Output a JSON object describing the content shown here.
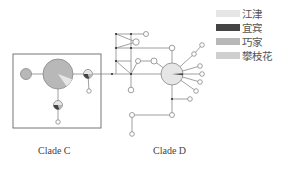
{
  "legend": {
    "items": [
      {
        "label": "江津",
        "color": "#e6e6e6"
      },
      {
        "label": "宜宾",
        "color": "#444444"
      },
      {
        "label": "巧家",
        "color": "#b8b8b8"
      },
      {
        "label": "攀枝花",
        "color": "#cfcfcf"
      }
    ]
  },
  "clades": [
    {
      "label": "Clade C",
      "x": 38,
      "y": 145
    },
    {
      "label": "Clade D",
      "x": 153,
      "y": 145
    }
  ],
  "box": {
    "x": 13,
    "y": 54,
    "w": 88,
    "h": 74
  },
  "edges": [
    [
      29,
      74,
      58,
      74
    ],
    [
      58,
      74,
      88,
      74
    ],
    [
      88,
      74,
      112,
      74
    ],
    [
      112,
      74,
      131,
      74
    ],
    [
      131,
      74,
      172,
      74
    ],
    [
      88,
      74,
      89,
      91
    ],
    [
      58,
      74,
      58,
      105
    ],
    [
      58,
      105,
      58,
      122
    ],
    [
      116,
      34,
      131,
      34
    ],
    [
      131,
      34,
      146,
      34
    ],
    [
      116,
      34,
      136,
      42
    ],
    [
      116,
      48,
      136,
      42
    ],
    [
      116,
      34,
      116,
      48
    ],
    [
      116,
      48,
      116,
      61
    ],
    [
      116,
      61,
      116,
      74
    ],
    [
      116,
      48,
      131,
      48
    ],
    [
      131,
      48,
      172,
      48
    ],
    [
      172,
      48,
      172,
      74
    ],
    [
      131,
      34,
      131,
      48
    ],
    [
      131,
      48,
      131,
      74
    ],
    [
      116,
      61,
      131,
      74
    ],
    [
      131,
      74,
      138,
      61
    ],
    [
      138,
      61,
      154,
      61
    ],
    [
      154,
      61,
      172,
      74
    ],
    [
      116,
      61,
      131,
      61
    ],
    [
      131,
      74,
      131,
      90
    ],
    [
      172,
      74,
      194,
      54
    ],
    [
      194,
      54,
      202,
      45
    ],
    [
      172,
      74,
      200,
      66
    ],
    [
      172,
      74,
      202,
      74
    ],
    [
      172,
      74,
      200,
      82
    ],
    [
      172,
      74,
      196,
      91
    ],
    [
      172,
      74,
      172,
      99
    ],
    [
      172,
      99,
      190,
      99
    ],
    [
      172,
      99,
      172,
      115
    ],
    [
      172,
      115,
      132,
      115
    ],
    [
      132,
      115,
      132,
      134
    ]
  ],
  "small_nodes": [
    [
      146,
      34
    ],
    [
      136,
      42
    ],
    [
      138,
      61
    ],
    [
      154,
      61
    ],
    [
      172,
      48
    ],
    [
      131,
      90
    ],
    [
      202,
      45
    ],
    [
      194,
      54
    ],
    [
      200,
      66
    ],
    [
      202,
      74
    ],
    [
      200,
      82
    ],
    [
      196,
      91
    ],
    [
      190,
      99
    ],
    [
      172,
      115
    ],
    [
      132,
      115
    ],
    [
      132,
      134
    ],
    [
      89,
      91
    ],
    [
      58,
      122
    ]
  ],
  "small_sizes": [
    2.5,
    3.2,
    2.5,
    3,
    2.8,
    2.8,
    2.3,
    2.3,
    2.3,
    2.3,
    2.3,
    2.3,
    2.3,
    2.5,
    2.5,
    2.3,
    2.2,
    2.2
  ],
  "dots": [
    [
      116,
      34
    ],
    [
      131,
      34
    ],
    [
      116,
      48
    ],
    [
      116,
      61
    ],
    [
      131,
      48
    ],
    [
      131,
      74
    ],
    [
      112,
      74
    ],
    [
      172,
      99
    ]
  ],
  "big_nodes": [
    {
      "name": "clade-c-main-haplotype",
      "x": 58,
      "y": 74,
      "r": 15,
      "color": "#b8b8b8",
      "slice": "#e6e6e6"
    },
    {
      "name": "clade-c-left-haplotype",
      "x": 26,
      "y": 74,
      "r": 5.5,
      "color": "#b8b8b8"
    },
    {
      "name": "clade-c-right-haplotype",
      "x": 88,
      "y": 74,
      "r": 4.5,
      "color": "#e6e6e6",
      "dark": true
    },
    {
      "name": "clade-c-lower-haplotype",
      "x": 58,
      "y": 105,
      "r": 4.5,
      "color": "#e6e6e6",
      "dark": true
    },
    {
      "name": "clade-d-main-haplotype",
      "x": 172,
      "y": 74,
      "r": 11,
      "color": "#e6e6e6",
      "wedge": "#444444"
    }
  ]
}
